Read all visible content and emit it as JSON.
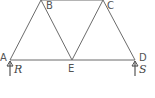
{
  "diagram": {
    "type": "truss",
    "nodes": [
      {
        "id": "A",
        "label": "A"
      },
      {
        "id": "B",
        "label": "B"
      },
      {
        "id": "C",
        "label": "C"
      },
      {
        "id": "D",
        "label": "D"
      },
      {
        "id": "E",
        "label": "E"
      }
    ],
    "members": [
      [
        "A",
        "B"
      ],
      [
        "B",
        "C"
      ],
      [
        "C",
        "D"
      ],
      [
        "A",
        "E"
      ],
      [
        "E",
        "D"
      ],
      [
        "B",
        "E"
      ],
      [
        "E",
        "C"
      ]
    ],
    "reactions": [
      {
        "at": "A",
        "label": "R",
        "direction": "up"
      },
      {
        "at": "D",
        "label": "S",
        "direction": "up"
      }
    ]
  }
}
